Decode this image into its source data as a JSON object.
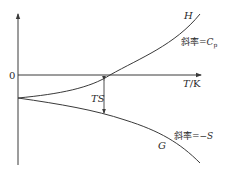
{
  "diagram": {
    "title": "",
    "axes": {
      "y_zero_label": "0",
      "x_label_var": "T",
      "x_label_unit": "/K"
    },
    "curves": [
      {
        "id": "H",
        "label": "H",
        "slope_label_prefix": "斜率=",
        "slope_label_var": "C",
        "slope_label_sub": "p"
      },
      {
        "id": "G",
        "label": "G",
        "slope_label_prefix": "斜率=",
        "slope_label_var": "−S"
      }
    ],
    "annotation": {
      "label": "TS",
      "meaning": "vertical gap between H and G"
    },
    "colors": {
      "line": "#3a3a3a",
      "text": "#2a2a2a",
      "background": "#ffffff"
    }
  }
}
